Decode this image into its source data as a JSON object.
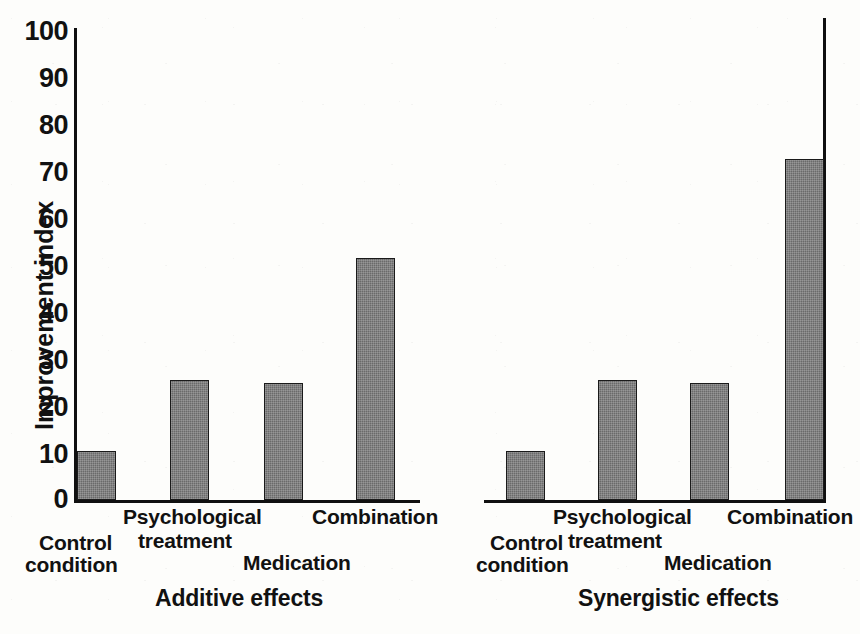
{
  "chart_data": {
    "type": "bar",
    "title": "",
    "xlabel": "",
    "ylabel": "Improvement index",
    "ylim": [
      0,
      100
    ],
    "yticks": [
      "0",
      "10",
      "20",
      "30",
      "40",
      "50",
      "60",
      "70",
      "80",
      "90",
      "100"
    ],
    "grid": false,
    "legend": "none",
    "categories": [
      "Control condition",
      "Psychological treatment",
      "Medication",
      "Combination"
    ],
    "panels": [
      {
        "name": "Additive effects",
        "title": "Additive effects",
        "values": [
          10.5,
          25.5,
          25,
          51.5
        ]
      },
      {
        "name": "Synergistic effects",
        "title": "Synergistic effects",
        "values": [
          10.5,
          25.5,
          25,
          72.5
        ]
      }
    ],
    "series": [
      {
        "name": "Additive effects",
        "values": [
          10.5,
          25.5,
          25,
          51.5
        ]
      },
      {
        "name": "Synergistic effects",
        "values": [
          10.5,
          25.5,
          25,
          72.5
        ]
      }
    ],
    "colors": {
      "bar_fill": "#6a6a6a",
      "bar_stroke": "#1a1a1a",
      "axis": "#101010",
      "text": "#111111",
      "background": "#fdfdfb"
    }
  },
  "axis": {
    "y_label": "Improvement index",
    "ticks": [
      "100",
      "90",
      "80",
      "70",
      "60",
      "50",
      "40",
      "30",
      "20",
      "10",
      "0"
    ]
  },
  "left_panel": {
    "title": "Additive effects",
    "labels": {
      "control_line1": "Control",
      "control_line2": "condition",
      "psych_line1": "Psychological",
      "psych_line2": "treatment",
      "medication": "Medication",
      "combination": "Combination"
    }
  },
  "right_panel": {
    "title": "Synergistic effects",
    "labels": {
      "control_line1": "Control",
      "control_line2": "condition",
      "psych_line1": "Psychological",
      "psych_line2": "treatment",
      "medication": "Medication",
      "combination": "Combination"
    }
  }
}
